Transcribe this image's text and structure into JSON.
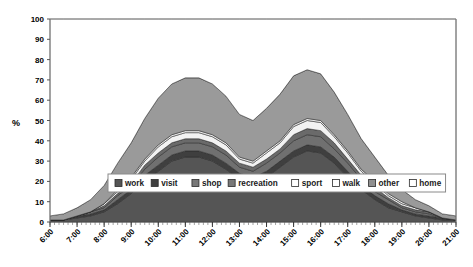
{
  "chart_data": {
    "type": "area",
    "title": "",
    "subtitle": "",
    "xlabel": "",
    "ylabel": "%",
    "stacked": true,
    "normalized_percent": true,
    "grid": false,
    "legend_position": "inside-bottom-center",
    "ylim": [
      0,
      100
    ],
    "yticks": [
      0,
      10,
      20,
      30,
      40,
      50,
      60,
      70,
      80,
      90,
      100
    ],
    "ytick_labels": [
      "0",
      "10",
      "20",
      "30",
      "40",
      "50",
      "60",
      "70",
      "80",
      "90",
      "100"
    ],
    "xlim": [
      "6:00",
      "21:00"
    ],
    "xtick_labels": [
      "6:00",
      "7:00",
      "8:00",
      "9:00",
      "10:00",
      "11:00",
      "12:00",
      "13:00",
      "14:00",
      "15:00",
      "16:00",
      "17:00",
      "18:00",
      "19:00",
      "20:00",
      "21:00"
    ],
    "x": [
      "6:00",
      "6:30",
      "7:00",
      "7:30",
      "8:00",
      "8:30",
      "9:00",
      "9:30",
      "10:00",
      "10:30",
      "11:00",
      "11:30",
      "12:00",
      "12:30",
      "13:00",
      "13:30",
      "14:00",
      "14:30",
      "15:00",
      "15:30",
      "16:00",
      "16:30",
      "17:00",
      "17:30",
      "18:00",
      "18:30",
      "19:00",
      "19:30",
      "20:00",
      "20:30",
      "21:00"
    ],
    "series": [
      {
        "name": "work",
        "color": "#555555",
        "values": [
          1,
          1,
          2,
          3,
          5,
          9,
          14,
          20,
          25,
          30,
          32,
          32,
          30,
          26,
          21,
          19,
          22,
          27,
          32,
          35,
          34,
          29,
          22,
          16,
          11,
          7,
          5,
          3,
          2,
          1,
          1
        ]
      },
      {
        "name": "visit",
        "color": "#3f3f3f",
        "values": [
          0,
          0,
          1,
          1,
          1,
          2,
          2,
          3,
          3,
          3,
          3,
          3,
          3,
          3,
          3,
          3,
          3,
          3,
          3,
          3,
          3,
          3,
          3,
          2,
          2,
          2,
          1,
          1,
          1,
          1,
          0
        ]
      },
      {
        "name": "shop",
        "color": "#707070",
        "values": [
          0,
          0,
          0,
          1,
          1,
          2,
          2,
          3,
          4,
          4,
          4,
          4,
          4,
          4,
          3,
          3,
          4,
          4,
          5,
          5,
          5,
          4,
          4,
          3,
          2,
          2,
          1,
          1,
          1,
          0,
          0
        ]
      },
      {
        "name": "recreation",
        "color": "#6a6a6a",
        "values": [
          0,
          0,
          0,
          0,
          1,
          1,
          1,
          2,
          2,
          2,
          2,
          2,
          2,
          2,
          2,
          2,
          2,
          2,
          3,
          3,
          3,
          3,
          2,
          2,
          2,
          1,
          1,
          1,
          1,
          0,
          0
        ]
      },
      {
        "name": "sport",
        "color": "#f2f2f2",
        "values": [
          0,
          0,
          0,
          0,
          1,
          1,
          2,
          2,
          3,
          3,
          3,
          3,
          3,
          3,
          2,
          2,
          3,
          3,
          4,
          4,
          4,
          3,
          3,
          2,
          2,
          1,
          1,
          1,
          0,
          0,
          0
        ]
      },
      {
        "name": "walk",
        "color": "#ededed",
        "values": [
          0,
          0,
          0,
          0,
          0,
          1,
          1,
          1,
          1,
          1,
          1,
          1,
          1,
          1,
          1,
          1,
          1,
          1,
          1,
          1,
          1,
          1,
          1,
          1,
          1,
          1,
          1,
          0,
          0,
          0,
          0
        ]
      },
      {
        "name": "other",
        "color": "#9a9a9a",
        "values": [
          2,
          3,
          4,
          6,
          9,
          13,
          17,
          20,
          23,
          25,
          26,
          26,
          25,
          23,
          21,
          20,
          21,
          23,
          24,
          24,
          23,
          21,
          18,
          15,
          12,
          9,
          6,
          4,
          3,
          2,
          2
        ]
      },
      {
        "name": "home",
        "color": "#ffffff",
        "values": [
          97,
          96,
          93,
          89,
          82,
          71,
          61,
          49,
          39,
          32,
          29,
          29,
          32,
          38,
          47,
          50,
          44,
          37,
          28,
          25,
          27,
          36,
          47,
          59,
          68,
          77,
          84,
          89,
          92,
          96,
          97
        ]
      }
    ],
    "band_top_values": {
      "description": "Cumulative stacked tops (work at bottom through other); home fills remainder to 100",
      "note": "All series sum to 100 at every x"
    }
  },
  "legend": {
    "items": [
      {
        "label": "work",
        "swatch": "filled-dark"
      },
      {
        "label": "visit",
        "swatch": "filled-darker"
      },
      {
        "label": "shop",
        "swatch": "filled-mid"
      },
      {
        "label": "recreation",
        "swatch": "filled-mid"
      },
      {
        "label": "sport",
        "swatch": "empty"
      },
      {
        "label": "walk",
        "swatch": "empty"
      },
      {
        "label": "other",
        "swatch": "filled-gray"
      },
      {
        "label": "home",
        "swatch": "empty"
      }
    ]
  },
  "axes": {
    "y_axis_title": "%"
  }
}
